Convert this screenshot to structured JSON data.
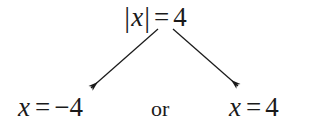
{
  "diagram": {
    "type": "absolute-value-equation-branching",
    "background_color": "#ffffff",
    "text_color": "#1a1a1a",
    "premise": {
      "label": "|x| = 4",
      "abs_open": "|",
      "variable": "x",
      "abs_close": "|",
      "equals": "=",
      "value": "4"
    },
    "conjunction": {
      "label": "or"
    },
    "left_branch": {
      "label": "x = −4",
      "variable": "x",
      "equals": "=",
      "value": "−4"
    },
    "right_branch": {
      "label": "x = 4",
      "variable": "x",
      "equals": "=",
      "value": "4"
    },
    "arrows": {
      "stroke_color": "#1a1a1a",
      "left": {
        "from_x": 158,
        "from_y": 29,
        "to_x": 91,
        "to_y": 88
      },
      "right": {
        "from_x": 173,
        "from_y": 29,
        "to_x": 238,
        "to_y": 86
      }
    }
  }
}
